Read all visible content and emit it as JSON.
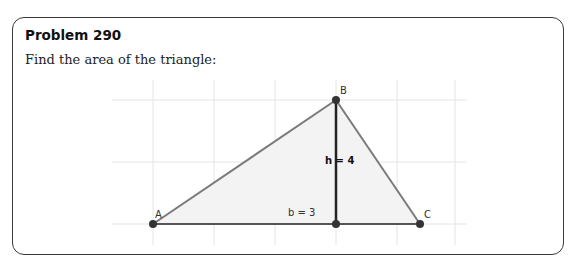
{
  "problem": {
    "title": "Problem 290",
    "prompt": "Find the area of the triangle:"
  },
  "figure": {
    "vertices": {
      "A": {
        "label": "A",
        "x": 0,
        "y": 0
      },
      "B": {
        "label": "B",
        "x": 3,
        "y": 2
      },
      "C": {
        "label": "C",
        "x": 4.4,
        "y": 0
      }
    },
    "height_label": "h = 4",
    "base_label": "b = 3",
    "colors": {
      "triangle_edge": "#777777",
      "altitude": "#222222",
      "fill": "#f2f2f2",
      "grid": "#e2e2e2",
      "point": "#333333"
    }
  }
}
